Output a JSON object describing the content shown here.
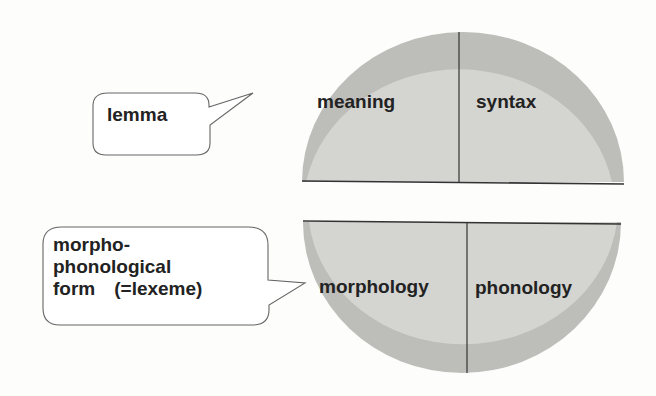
{
  "diagram": {
    "top_half": {
      "left_label": "meaning",
      "right_label": "syntax"
    },
    "bottom_half": {
      "left_label": "morphology",
      "right_label": "phonology"
    },
    "callouts": {
      "lemma": {
        "text": "lemma"
      },
      "lexeme": {
        "line1": "morpho-",
        "line2": "phonological",
        "line3": "form　(=lexeme)"
      }
    },
    "colors": {
      "fill": "#d4d4d1",
      "rim": "#bdbdb9",
      "line": "#333333",
      "text": "#222222",
      "bubble_stroke": "#666666"
    }
  }
}
